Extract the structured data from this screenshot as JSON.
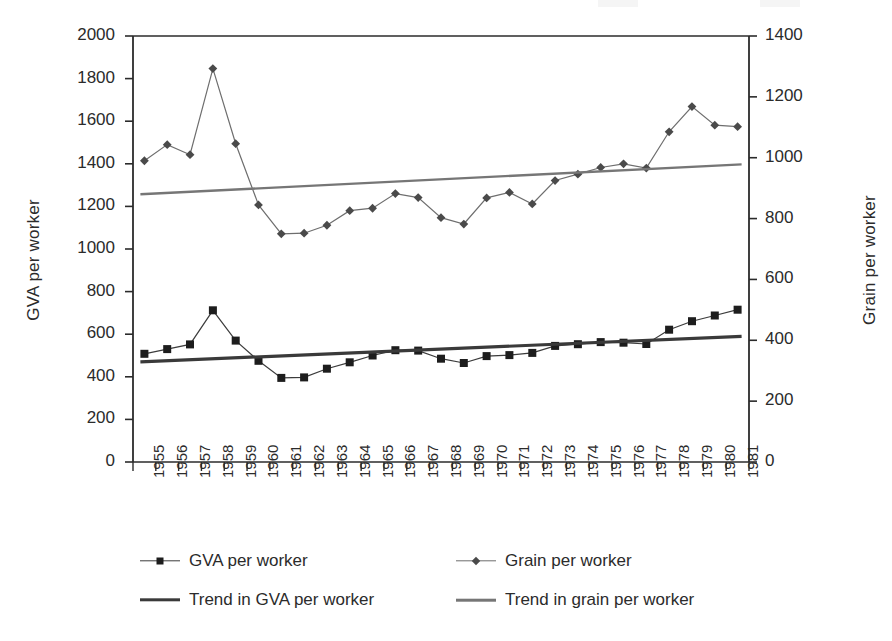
{
  "chart_data": {
    "type": "line",
    "title": "",
    "xlabel": "",
    "ylabel": "GVA per worker",
    "y2label": "Grain per worker",
    "ylim": [
      0,
      2000
    ],
    "y2lim": [
      0,
      1400
    ],
    "grid": false,
    "legend_position": "bottom",
    "x": [
      1955,
      1956,
      1957,
      1958,
      1959,
      1960,
      1961,
      1962,
      1963,
      1964,
      1965,
      1966,
      1967,
      1968,
      1969,
      1970,
      1971,
      1972,
      1973,
      1974,
      1975,
      1976,
      1977,
      1978,
      1979,
      1980,
      1981
    ],
    "categories": [
      "1955",
      "1956",
      "1957",
      "1958",
      "1959",
      "1960",
      "1961",
      "1962",
      "1963",
      "1964",
      "1965",
      "1966",
      "1967",
      "1968",
      "1969",
      "1970",
      "1971",
      "1972",
      "1973",
      "1974",
      "1975",
      "1976",
      "1977",
      "1978",
      "1979",
      "1980",
      "1981"
    ],
    "y_ticks": [
      0,
      200,
      400,
      600,
      800,
      1000,
      1200,
      1400,
      1600,
      1800,
      2000
    ],
    "y_tick_labels": [
      "0",
      "200",
      "400",
      "600",
      "800",
      "1000",
      "1200",
      "1400",
      "1600",
      "1800",
      "2000"
    ],
    "y2_ticks": [
      0,
      200,
      400,
      600,
      800,
      1000,
      1200,
      1400
    ],
    "y2_tick_labels": [
      "0",
      "200",
      "400",
      "600",
      "800",
      "1000",
      "1200",
      "1400"
    ],
    "series": [
      {
        "name": "GVA per worker",
        "axis": "left",
        "marker": "square",
        "color": "#1d1d1d",
        "line_color": "#3c3c3c",
        "values": [
          508,
          530,
          552,
          712,
          570,
          475,
          395,
          397,
          438,
          468,
          500,
          525,
          523,
          485,
          465,
          497,
          502,
          512,
          545,
          553,
          563,
          560,
          554,
          621,
          661,
          688,
          715
        ]
      },
      {
        "name": "Grain per worker",
        "axis": "right",
        "marker": "diamond",
        "color": "#4a4a4a",
        "line_color": "#6e6e6e",
        "values": [
          990,
          1043,
          1010,
          1293,
          1046,
          845,
          750,
          752,
          778,
          826,
          834,
          882,
          869,
          803,
          782,
          868,
          886,
          848,
          925,
          946,
          968,
          980,
          966,
          1085,
          1168,
          1107,
          1102
        ]
      },
      {
        "name": "Trend in GVA per worker",
        "axis": "left",
        "marker": "none",
        "color": "#3a3a3a",
        "line_color": "#3a3a3a",
        "type": "trend",
        "endpoints": [
          470,
          590
        ]
      },
      {
        "name": "Trend in grain per worker",
        "axis": "right",
        "marker": "none",
        "color": "#767676",
        "line_color": "#767676",
        "type": "trend",
        "endpoints": [
          880,
          978
        ]
      }
    ]
  },
  "axes": {
    "left_title": "GVA per worker",
    "right_title": "Grain per worker"
  },
  "legend": {
    "items": [
      {
        "label": "GVA per worker",
        "marker": "square-line-marker",
        "style": "thin-dark"
      },
      {
        "label": "Grain per worker",
        "marker": "diamond-line-marker",
        "style": "thin-grey"
      },
      {
        "label": "Trend in GVA per worker",
        "marker": "solid-line-dark",
        "style": "thick-dark"
      },
      {
        "label": "Trend in grain per worker",
        "marker": "solid-line-grey",
        "style": "thick-grey"
      }
    ]
  },
  "colors": {
    "gva_marker": "#1d1d1d",
    "grain_marker": "#4a4a4a",
    "gva_trend": "#3a3a3a",
    "grain_trend": "#767676",
    "axis": "#2b2b2b",
    "background": "#ffffff"
  }
}
